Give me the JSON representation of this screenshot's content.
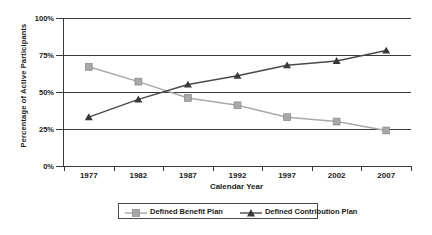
{
  "chart_data": {
    "type": "line",
    "title": "",
    "xlabel": "Calendar Year",
    "ylabel": "Percentage of Active Participants",
    "categories": [
      "1977",
      "1982",
      "1987",
      "1992",
      "1997",
      "2002",
      "2007"
    ],
    "ylim": [
      0,
      100
    ],
    "yticks": [
      "0%",
      "25%",
      "50%",
      "75%",
      "100%"
    ],
    "ytick_values": [
      0,
      25,
      50,
      75,
      100
    ],
    "grid": true,
    "legend_position": "bottom",
    "series": [
      {
        "name": "Defined Benefit Plan",
        "color": "#a8a8a8",
        "marker": "square",
        "values": [
          67,
          57,
          46,
          41,
          33,
          30,
          24
        ]
      },
      {
        "name": "Defined Contribution Plan",
        "color": "#4a4a4a",
        "marker": "triangle",
        "values": [
          33,
          45,
          55,
          61,
          68,
          71,
          78
        ]
      }
    ]
  },
  "axes": {
    "ylabel": "Percentage of Active Participants",
    "xlabel": "Calendar Year"
  },
  "legend": {
    "items": [
      {
        "label": "Defined Benefit Plan",
        "color": "#a8a8a8",
        "marker": "square"
      },
      {
        "label": "Defined Contribution Plan",
        "color": "#4a4a4a",
        "marker": "triangle"
      }
    ]
  },
  "colors": {
    "axis": "#3a3a3a",
    "benefit": "#a8a8a8",
    "contribution": "#4a4a4a",
    "background": "#ffffff"
  }
}
